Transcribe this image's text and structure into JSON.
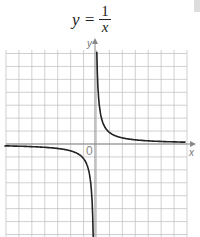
{
  "chart_data": {
    "type": "line",
    "xlabel": "x",
    "ylabel": "y",
    "origin_label": "0",
    "function": "y = 1/x",
    "xlim": [
      -7,
      7
    ],
    "ylim": [
      -7,
      7.5
    ],
    "grid": true,
    "series": [
      {
        "name": "y = 1/x (x>0)",
        "x": [
          0.14,
          0.25,
          0.5,
          1,
          2,
          3,
          4,
          5,
          6,
          7
        ],
        "y": [
          7.14,
          4,
          2,
          1,
          0.5,
          0.33,
          0.25,
          0.2,
          0.17,
          0.14
        ]
      },
      {
        "name": "y = 1/x (x<0)",
        "x": [
          -7,
          -6,
          -5,
          -4,
          -3,
          -2,
          -1,
          -0.5,
          -0.25,
          -0.14
        ],
        "y": [
          -0.14,
          -0.17,
          -0.2,
          -0.25,
          -0.33,
          -0.5,
          -1,
          -2,
          -4,
          -7.14
        ]
      }
    ]
  },
  "title": {
    "lhs": "y =",
    "num": "1",
    "den": "x"
  },
  "axes": {
    "x_label": "x",
    "y_label": "y",
    "origin": "0"
  },
  "colors": {
    "curve": "#222222",
    "grid": "#bbbbbb",
    "axis": "#888888"
  }
}
